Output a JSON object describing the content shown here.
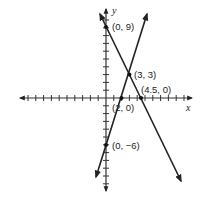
{
  "chart_data": {
    "type": "line",
    "title": "",
    "xlabel": "x",
    "ylabel": "y",
    "xlim": [
      -11,
      11
    ],
    "ylim": [
      -12,
      11
    ],
    "grid": false,
    "series": [
      {
        "name": "line-1",
        "equation": "y = 3x - 6",
        "points": [
          [
            0,
            -6
          ],
          [
            2,
            0
          ],
          [
            3,
            3
          ]
        ],
        "extends": [
          [
            -1.3,
            -10
          ],
          [
            5.3,
            10
          ]
        ]
      },
      {
        "name": "line-2",
        "equation": "y = -2x + 9",
        "points": [
          [
            0,
            9
          ],
          [
            3,
            3
          ],
          [
            4.5,
            0
          ]
        ],
        "extends": [
          [
            -0.8,
            10.8
          ],
          [
            9.8,
            -10.8
          ]
        ]
      }
    ],
    "annotations": [
      {
        "label": "(0, 9)",
        "x": 0,
        "y": 9
      },
      {
        "label": "(3, 3)",
        "x": 3,
        "y": 3
      },
      {
        "label": "(4.5, 0)",
        "x": 4.5,
        "y": 0
      },
      {
        "label": "(2, 0)",
        "x": 2,
        "y": 0
      },
      {
        "label": "(0, −6)",
        "x": 0,
        "y": -6
      }
    ]
  },
  "labels": {
    "x_axis": "x",
    "y_axis": "y",
    "p_0_9": "(0, 9)",
    "p_3_3": "(3, 3)",
    "p_45_0": "(4.5, 0)",
    "p_2_0": "(2, 0)",
    "p_0_m6": "(0, −6)"
  }
}
